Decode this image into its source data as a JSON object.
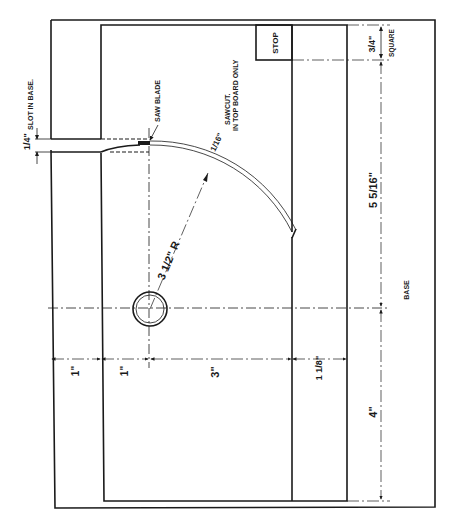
{
  "drawing": {
    "title": "Circle-cutting saw jig plan view",
    "colors": {
      "ink": "#1a1a1a",
      "paper": "#ffffff"
    }
  },
  "labels": {
    "slot_fraction": "1/4\"",
    "slot_text": "SLOT IN BASE.",
    "saw_blade": "SAW BLADE",
    "sawcut_fraction": "1/16\"",
    "sawcut_line1": "SAWCUT.",
    "sawcut_line2": "IN TOP BOARD ONLY",
    "radius": "3 1/2\" R",
    "stop": "STOP",
    "square_fraction": "3/4\"",
    "square_text": "SQUARE",
    "dim_5_5_16": "5 5/16\"",
    "base": "BASE",
    "dim_1a": "1\"",
    "dim_1b": "1\"",
    "dim_3": "3\"",
    "dim_1_1_8": "1 1/8\"",
    "dim_4": "4\""
  },
  "dimensions": [
    {
      "name": "slot-width",
      "value": "1/4\""
    },
    {
      "name": "sawcut-width",
      "value": "1/16\""
    },
    {
      "name": "cut-radius",
      "value": "3 1/2\" R"
    },
    {
      "name": "stop-square",
      "value": "3/4\""
    },
    {
      "name": "pivot-to-stop",
      "value": "5 5/16\""
    },
    {
      "name": "base-edge-to-board",
      "value": "1\""
    },
    {
      "name": "board-edge-to-pivot",
      "value": "1\""
    },
    {
      "name": "pivot-to-fence",
      "value": "3\""
    },
    {
      "name": "fence-width",
      "value": "1 1/8\""
    },
    {
      "name": "pivot-to-base-end",
      "value": "4\""
    }
  ]
}
